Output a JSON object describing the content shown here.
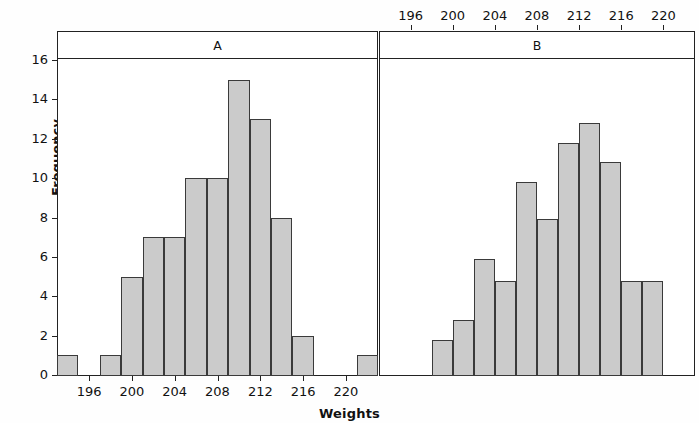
{
  "chart_data": {
    "type": "bar",
    "title": "",
    "subtitle": "",
    "xlabel": "Weights",
    "ylabel": "Frequency",
    "ylim": [
      0,
      16
    ],
    "xlim": [
      193,
      223
    ],
    "grid": false,
    "legend_position": "none",
    "bin_width": 2,
    "yticks": [
      0,
      2,
      4,
      6,
      8,
      10,
      12,
      14,
      16
    ],
    "panels": [
      {
        "name": "A",
        "axis_position": "bottom",
        "xticks": [
          196,
          200,
          204,
          208,
          212,
          216,
          220
        ],
        "bin_starts": [
          193,
          195,
          197,
          199,
          201,
          203,
          205,
          207,
          209,
          211,
          213,
          215,
          217,
          219,
          221
        ],
        "values": [
          1,
          0,
          1,
          5,
          7,
          7,
          10,
          10,
          15,
          13,
          8,
          2,
          0,
          0,
          1
        ]
      },
      {
        "name": "B",
        "axis_position": "top",
        "xticks": [
          196,
          200,
          204,
          208,
          212,
          216,
          220
        ],
        "bin_starts": [
          198,
          200,
          202,
          204,
          206,
          208,
          210,
          212,
          214,
          216,
          218
        ],
        "values": [
          1.8,
          2.8,
          5.9,
          4.8,
          9.8,
          7.9,
          11.8,
          12.8,
          10.8,
          4.8,
          4.8
        ]
      }
    ],
    "colors": {
      "bar_fill": "#cbcbcb",
      "bar_stroke": "#3a3a3a",
      "axis": "#222222",
      "background": "#fefefe"
    }
  }
}
